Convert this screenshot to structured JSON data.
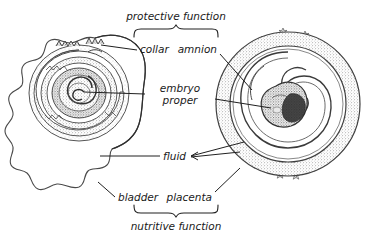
{
  "figure": {
    "background_color": "#ffffff",
    "ink_color": "#2b2b2b",
    "stipple_color": "#8c8c8c"
  },
  "braces": {
    "top": {
      "label": "protective function",
      "orientation": "down"
    },
    "bottom": {
      "label": "nutritive function",
      "orientation": "up"
    }
  },
  "labels": {
    "collar": "collar",
    "amnion": "amnion",
    "embryo_proper_line1": "embryo",
    "embryo_proper_line2": "proper",
    "fluid": "fluid",
    "bladder": "bladder",
    "placenta": "placenta"
  },
  "panels": [
    {
      "name": "left-panel",
      "structure": "yolk-sac / bladder with coiled spiral embryo",
      "parts": [
        "bladder",
        "collar",
        "embryo proper",
        "fluid"
      ]
    },
    {
      "name": "right-panel",
      "structure": "circular placenta with villi, amnion sac and curled embryo",
      "parts": [
        "placenta",
        "amnion",
        "embryo proper",
        "fluid"
      ]
    }
  ]
}
